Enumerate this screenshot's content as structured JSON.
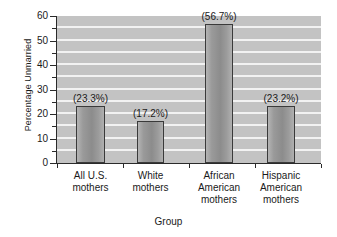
{
  "chart_data": {
    "type": "bar",
    "title": "",
    "xlabel": "Group",
    "ylabel": "Percentage Unmarried",
    "ylim": [
      0,
      60
    ],
    "yticks": [
      0,
      10,
      20,
      30,
      40,
      50,
      60
    ],
    "ytick_labels": [
      "0",
      "10",
      "20",
      "30",
      "40",
      "50",
      "60"
    ],
    "minor_tick_step": 5,
    "grid": true,
    "grid_axis": "y",
    "grid_step": 5,
    "legend": "none",
    "plot_background": "#c3c3c3",
    "gridline_color": "#f2f2f2",
    "bar_color": "#9a9a9a",
    "bar_edge_color": "#3a3a3a",
    "categories": [
      "All U.S. mothers",
      "White mothers",
      "African American mothers",
      "Hispanic American mothers"
    ],
    "category_lines": [
      [
        "All U.S.",
        "mothers"
      ],
      [
        "White",
        "mothers"
      ],
      [
        "African",
        "American",
        "mothers"
      ],
      [
        "Hispanic",
        "American",
        "mothers"
      ]
    ],
    "values": [
      23.3,
      17.2,
      56.7,
      23.2
    ],
    "data_labels": [
      "(23.3%)",
      "(17.2%)",
      "(56.7%)",
      "(23.2%)"
    ]
  },
  "axis": {
    "y_title": "Percentage Unmarried",
    "x_title": "Group"
  }
}
